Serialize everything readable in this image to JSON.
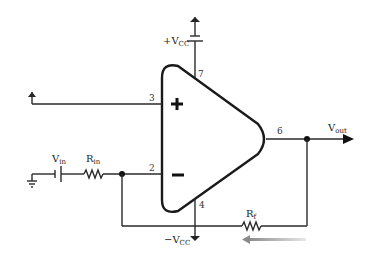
{
  "diagram": {
    "type": "inverting operational amplifier circuit",
    "opamp": {
      "inputs": {
        "noninverting_symbol": "+",
        "inverting_symbol": "−"
      },
      "pins": {
        "noninverting_input": "3",
        "inverting_input": "2",
        "output": "6",
        "positive_supply": "7",
        "negative_supply": "4"
      }
    },
    "labels": {
      "vcc_pos": {
        "main": "+V",
        "sub": "CC"
      },
      "vcc_neg": {
        "main": "−V",
        "sub": "CC"
      },
      "vin": {
        "main": "V",
        "sub": "in"
      },
      "rin": {
        "main": "R",
        "sub": "in"
      },
      "rf": {
        "main": "R",
        "sub": "f"
      },
      "vout": {
        "main": "V",
        "sub": "out"
      }
    },
    "annotations": {
      "current_arrow": "feedback current direction (right to left)"
    },
    "colors": {
      "line": "#2a2a2a",
      "arrow": "#9a9a9a"
    }
  }
}
